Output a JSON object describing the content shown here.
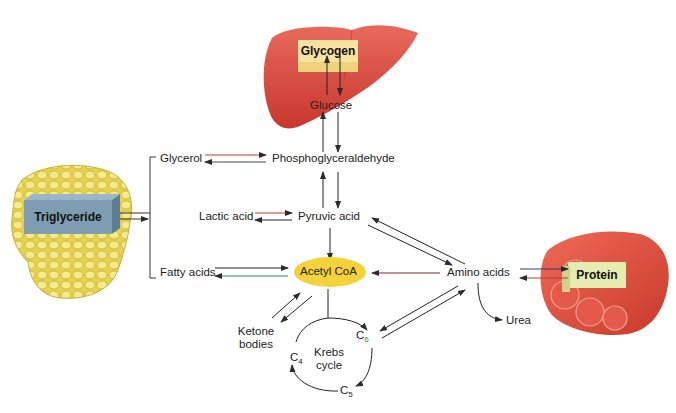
{
  "diagram": {
    "organs": {
      "liver": {
        "icon": "liver-illustration",
        "color": "#d9463b",
        "box_label": "Glycogen",
        "box_color": "#f6e3a0"
      },
      "adipose": {
        "icon": "adipose-tissue-illustration",
        "color": "#e8d44a",
        "box_label": "Triglyceride",
        "box_color": "#7e9db3"
      },
      "muscle": {
        "icon": "muscle-fiber-illustration",
        "color": "#e04a3a",
        "box_label": "Protein",
        "box_color": "#e6ecb0"
      }
    },
    "nodes": {
      "glucose": "Glucose",
      "glycerol": "Glycerol",
      "phosphoglyceraldehyde": "Phosphoglyceraldehyde",
      "lactic_acid": "Lactic acid",
      "pyruvic_acid": "Pyruvic acid",
      "fatty_acids": "Fatty acids",
      "acetyl_coa": "Acetyl CoA",
      "amino_acids": "Amino acids",
      "urea": "Urea",
      "ketone_bodies_line1": "Ketone",
      "ketone_bodies_line2": "bodies",
      "krebs_line1": "Krebs",
      "krebs_line2": "cycle",
      "c6": "C",
      "c6_sub": "6",
      "c5": "C",
      "c5_sub": "5",
      "c4": "C",
      "c4_sub": "4"
    },
    "colors": {
      "acetyl_coa_fill": "#f3d23a",
      "arrow": "#2b2b2b",
      "arrow_red": "#c0392b",
      "arrow_green": "#2e8b3e"
    }
  }
}
